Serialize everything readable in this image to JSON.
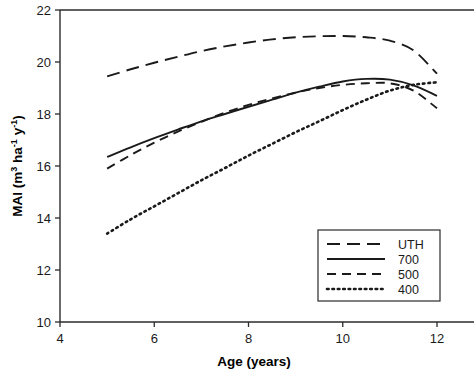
{
  "chart_data": {
    "type": "line",
    "title": "",
    "xlabel": "Age (years)",
    "ylabel": "MAI (m3 ha-1 y-1)",
    "ylabel_parts": {
      "prefix": "MAI (m",
      "sup1": "3",
      "mid1": " ha",
      "sup2": "-1",
      "mid2": " y",
      "sup3": "-1",
      "suffix": ")"
    },
    "xlim": [
      4,
      12
    ],
    "ylim": [
      10,
      22
    ],
    "xticks": [
      "4",
      "6",
      "8",
      "10",
      "12"
    ],
    "xtick_values": [
      4,
      6,
      8,
      10,
      12
    ],
    "yticks": [
      "10",
      "12",
      "14",
      "16",
      "18",
      "20",
      "22"
    ],
    "ytick_values": [
      10,
      12,
      14,
      16,
      18,
      20,
      22
    ],
    "grid": false,
    "legend_position": "lower right",
    "x": [
      5,
      5.5,
      6,
      6.5,
      7,
      7.5,
      8,
      8.5,
      9,
      9.5,
      10,
      10.5,
      11,
      11.5,
      12
    ],
    "series": [
      {
        "name": "UTH",
        "style": "long-dash",
        "color": "#1a1a1a",
        "values": [
          19.45,
          19.72,
          19.97,
          20.2,
          20.42,
          20.6,
          20.75,
          20.87,
          20.95,
          20.99,
          21.0,
          20.95,
          20.82,
          20.45,
          19.55
        ]
      },
      {
        "name": "700",
        "style": "solid",
        "color": "#1a1a1a",
        "values": [
          16.35,
          16.72,
          17.07,
          17.4,
          17.72,
          18.0,
          18.28,
          18.55,
          18.82,
          19.05,
          19.25,
          19.35,
          19.32,
          19.1,
          18.7
        ]
      },
      {
        "name": "500",
        "style": "dash",
        "color": "#1a1a1a",
        "values": [
          15.9,
          16.42,
          16.9,
          17.32,
          17.7,
          18.05,
          18.35,
          18.6,
          18.82,
          19.0,
          19.12,
          19.18,
          19.18,
          18.9,
          18.22
        ]
      },
      {
        "name": "400",
        "style": "dotted",
        "color": "#1a1a1a",
        "values": [
          13.4,
          13.95,
          14.45,
          14.95,
          15.45,
          15.92,
          16.4,
          16.85,
          17.3,
          17.72,
          18.15,
          18.55,
          18.9,
          19.12,
          19.22
        ]
      }
    ],
    "legend_entries": [
      {
        "label": "UTH",
        "style": "long-dash"
      },
      {
        "label": "700",
        "style": "solid"
      },
      {
        "label": "500",
        "style": "dash"
      },
      {
        "label": "400",
        "style": "dotted"
      }
    ]
  }
}
